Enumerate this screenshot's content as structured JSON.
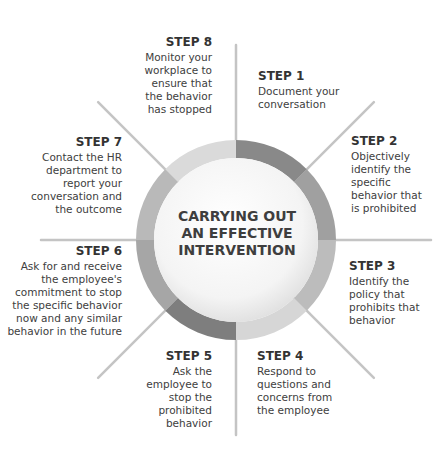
{
  "center": {
    "line1": "CARRYING OUT",
    "line2": "AN EFFECTIVE",
    "line3": "INTERVENTION"
  },
  "ring": {
    "cx": 236,
    "cy": 240,
    "outer_r": 100,
    "inner_r": 82,
    "segment_colors": [
      "#898989",
      "#a0a0a0",
      "#bcbcbc",
      "#d6d6d6",
      "#7e7e7e",
      "#a6a6a6",
      "#b9b9b9",
      "#dadada"
    ]
  },
  "steps": [
    {
      "title": "STEP 1",
      "lines": [
        "Document your",
        "conversation"
      ]
    },
    {
      "title": "STEP 2",
      "lines": [
        "Objectively",
        "identify the",
        "specific",
        "behavior that",
        "is prohibited"
      ]
    },
    {
      "title": "STEP 3",
      "lines": [
        "Identify the",
        "policy that",
        "prohibits that",
        "behavior"
      ]
    },
    {
      "title": "STEP 4",
      "lines": [
        "Respond to",
        "questions and",
        "concerns from",
        "the employee"
      ]
    },
    {
      "title": "STEP 5",
      "lines": [
        "Ask the",
        "employee to",
        "stop the",
        "prohibited",
        "behavior"
      ]
    },
    {
      "title": "STEP 6",
      "lines": [
        "Ask for and receive",
        "the employee's",
        "commitment to stop",
        "the specific behavior",
        "now and any similar",
        "behavior in the future"
      ]
    },
    {
      "title": "STEP 7",
      "lines": [
        "Contact the HR",
        "department to",
        "report your",
        "conversation and",
        "the outcome"
      ]
    },
    {
      "title": "STEP 8",
      "lines": [
        "Monitor your",
        "workplace to",
        "ensure that",
        "the behavior",
        "has stopped"
      ]
    }
  ]
}
